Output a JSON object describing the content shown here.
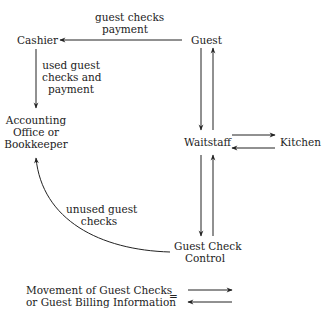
{
  "nodes": {
    "cashier": "Cashier",
    "guest": "Guest",
    "accounting_l1": "Accounting",
    "accounting_l2": "Office or",
    "accounting_l3": "Bookkeeper",
    "waitstaff": "Waitstaff",
    "kitchen": "Kitchen",
    "gcc_l1": "Guest Check",
    "gcc_l2": "Control"
  },
  "edges": {
    "guest_to_cashier_l1": "guest checks",
    "guest_to_cashier_l2": "payment",
    "cashier_to_accounting_l1": "used guest",
    "cashier_to_accounting_l2": "checks and",
    "cashier_to_accounting_l3": "payment",
    "gcc_to_accounting_l1": "unused guest",
    "gcc_to_accounting_l2": "checks"
  },
  "legend": {
    "line1": "Movement of Guest Checks",
    "line2": "or Guest Billing Information",
    "equals": "="
  },
  "colors": {
    "ink": "#222222",
    "background": "#ffffff"
  }
}
